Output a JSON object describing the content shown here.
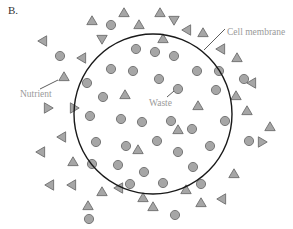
{
  "panel_label": "B.",
  "labels": {
    "cell_membrane": "Cell membrane",
    "nutrient": "Nutrient",
    "waste": "Waste"
  },
  "legend": {
    "triangle": "nutrient",
    "circle": "waste"
  },
  "colors": {
    "membrane": "#1a1a1a",
    "particle_fill": "#a6a6a6",
    "particle_stroke": "#6e6e6e",
    "callout_text": "#9a9a9a",
    "leader_line": "#333333"
  },
  "particle_counts": {
    "waste_inside": 33,
    "nutrient_inside": 4,
    "nutrient_outside": 35,
    "waste_outside": 6
  }
}
